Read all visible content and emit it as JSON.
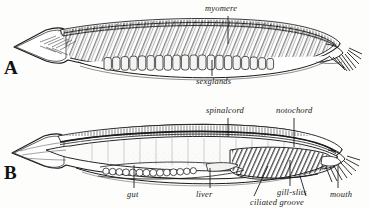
{
  "figure": {
    "background_color": "#fdfdfc",
    "ink_color": "#1a1a1a",
    "panels": [
      {
        "id": "A",
        "letter": "A",
        "description": "lateral view showing myomeres and sex glands"
      },
      {
        "id": "B",
        "letter": "B",
        "description": "sagittal section showing spinal cord, notochord, gut, liver, gill-slits, ciliated groove and mouth"
      }
    ]
  },
  "panel_a": {
    "letter": "A",
    "labels": {
      "myomere": "myomere",
      "sexglands": "sexglands"
    }
  },
  "panel_b": {
    "letter": "B",
    "labels": {
      "spinalcord": "spinalcord",
      "notochord": "notochord",
      "gut": "gut",
      "liver": "liver",
      "gill_slits": "gill-slits",
      "ciliated_groove": "ciliated groove",
      "mouth": "mouth"
    }
  }
}
